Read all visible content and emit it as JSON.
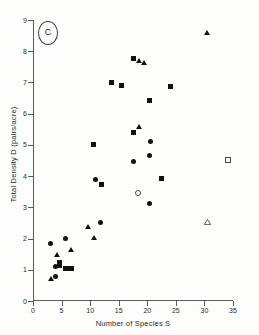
{
  "figure": {
    "panel_tag": "C",
    "background": "#fdfdfc",
    "marker_color": "#111111",
    "axis_color": "#5a5a5a"
  },
  "chart_data": {
    "type": "scatter",
    "title": "",
    "panel_label": "C",
    "xlabel": "Number of  Species  S",
    "ylabel": "Total Density D (pairs/acre)",
    "xlim": [
      0,
      35
    ],
    "ylim": [
      0,
      9
    ],
    "xticks": [
      0,
      5,
      10,
      15,
      20,
      25,
      30,
      35
    ],
    "xtick_labels": [
      "0",
      "5",
      "10",
      "15",
      "20",
      "25",
      "30",
      "35"
    ],
    "yticks": [
      0,
      1,
      2,
      3,
      4,
      5,
      6,
      7,
      8,
      9
    ],
    "ytick_labels": [
      "0",
      "1",
      "2",
      "3",
      "4",
      "5",
      "6",
      "7",
      "8",
      "9"
    ],
    "grid": false,
    "legend": false,
    "series": [
      {
        "name": "filled-circle",
        "marker": "circle",
        "fill": "filled",
        "points": [
          {
            "x": 3.0,
            "y": 1.85
          },
          {
            "x": 3.9,
            "y": 1.12
          },
          {
            "x": 5.6,
            "y": 2.0
          },
          {
            "x": 4.0,
            "y": 0.78
          },
          {
            "x": 10.9,
            "y": 3.88
          },
          {
            "x": 11.8,
            "y": 2.52
          },
          {
            "x": 17.6,
            "y": 4.48
          },
          {
            "x": 20.4,
            "y": 4.66
          },
          {
            "x": 20.4,
            "y": 3.11
          },
          {
            "x": 20.6,
            "y": 5.12
          }
        ]
      },
      {
        "name": "filled-square",
        "marker": "square",
        "fill": "filled",
        "points": [
          {
            "x": 4.6,
            "y": 1.15
          },
          {
            "x": 4.7,
            "y": 1.22
          },
          {
            "x": 5.6,
            "y": 1.05
          },
          {
            "x": 6.2,
            "y": 1.05
          },
          {
            "x": 6.8,
            "y": 1.03
          },
          {
            "x": 10.5,
            "y": 5.02
          },
          {
            "x": 11.9,
            "y": 3.74
          },
          {
            "x": 13.8,
            "y": 7.0
          },
          {
            "x": 15.4,
            "y": 6.9
          },
          {
            "x": 17.6,
            "y": 7.76
          },
          {
            "x": 17.6,
            "y": 5.4
          },
          {
            "x": 20.4,
            "y": 6.42
          },
          {
            "x": 22.4,
            "y": 3.92
          },
          {
            "x": 24.1,
            "y": 6.88
          }
        ]
      },
      {
        "name": "filled-triangle",
        "marker": "triangle",
        "fill": "filled",
        "points": [
          {
            "x": 3.1,
            "y": 0.72
          },
          {
            "x": 4.2,
            "y": 1.46
          },
          {
            "x": 6.7,
            "y": 1.62
          },
          {
            "x": 9.7,
            "y": 2.36
          },
          {
            "x": 10.7,
            "y": 2.02
          },
          {
            "x": 18.5,
            "y": 7.68
          },
          {
            "x": 19.4,
            "y": 7.62
          },
          {
            "x": 18.6,
            "y": 5.58
          },
          {
            "x": 30.5,
            "y": 8.58
          }
        ]
      },
      {
        "name": "open-circle",
        "marker": "circle",
        "fill": "open",
        "points": [
          {
            "x": 18.3,
            "y": 3.48
          }
        ]
      },
      {
        "name": "open-square",
        "marker": "square",
        "fill": "open",
        "points": [
          {
            "x": 34.0,
            "y": 4.52
          }
        ]
      },
      {
        "name": "open-triangle",
        "marker": "triangle",
        "fill": "open",
        "points": [
          {
            "x": 30.4,
            "y": 2.52
          }
        ]
      }
    ]
  }
}
